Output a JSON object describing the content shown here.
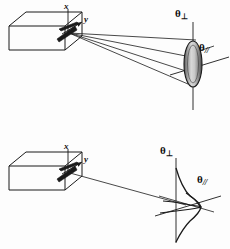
{
  "figure": {
    "background_color": "#fdfdfd",
    "ink_color": "#1a1a1a",
    "panels": [
      {
        "id": "top",
        "name": "elliptical-far-field-panel",
        "description": "Rectangular laser diode package emitting a diverging fan of rays onto a vertically elongated shaded ellipse representing the elliptical far-field beam spot.",
        "emitter": {
          "name": "laser-diode-box",
          "shape": "rectangular-prism",
          "axis_labels": [
            {
              "name": "x-axis-label",
              "text": "x"
            },
            {
              "name": "y-axis-label",
              "text": "y"
            }
          ]
        },
        "beam": {
          "name": "ray-fan",
          "ray_count": 4,
          "style": "diverging-cone"
        },
        "spot": {
          "name": "elliptical-beam-spot",
          "shape": "ellipse",
          "orientation": "vertical-major-axis",
          "fill": "shaded-gradient"
        },
        "angle_labels": [
          {
            "name": "theta-perpendicular-label",
            "symbol": "θ",
            "subscript": "⊥",
            "axis": "vertical"
          },
          {
            "name": "theta-parallel-label",
            "symbol": "θ",
            "subscript": "//",
            "axis": "horizontal"
          }
        ]
      },
      {
        "id": "bottom",
        "name": "intensity-profile-panel",
        "description": "Same laser diode package emitting a single axial ray toward a pair of crossed Gaussian intensity profile curves plotted on the perpendicular and parallel angular axes.",
        "emitter": {
          "name": "laser-diode-box",
          "shape": "rectangular-prism",
          "axis_labels": [
            {
              "name": "x-axis-label",
              "text": "x"
            },
            {
              "name": "y-axis-label",
              "text": "y"
            }
          ]
        },
        "beam": {
          "name": "axial-ray",
          "ray_count": 1,
          "style": "single-line"
        },
        "profiles": [
          {
            "name": "perpendicular-gaussian-curve",
            "axis": "theta-perpendicular",
            "width": "broad"
          },
          {
            "name": "parallel-gaussian-curve",
            "axis": "theta-parallel",
            "width": "narrow"
          }
        ],
        "angle_labels": [
          {
            "name": "theta-perpendicular-label",
            "symbol": "θ",
            "subscript": "⊥",
            "axis": "vertical"
          },
          {
            "name": "theta-parallel-label",
            "symbol": "θ",
            "subscript": "//",
            "axis": "horizontal"
          }
        ]
      }
    ],
    "labels": {
      "x": "x",
      "y": "y",
      "theta": "θ",
      "perp_sub": "⊥",
      "par_sub": "//"
    }
  }
}
